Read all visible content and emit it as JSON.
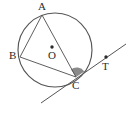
{
  "figure": {
    "kind": "circle-geometry-diagram",
    "background_color": "#ffffff",
    "stroke_color": "#555555",
    "label_color": "#2b2b2b",
    "shade_color": "#8a8a8a",
    "width": 133,
    "height": 115
  },
  "circle": {
    "name": "circle-O",
    "center": {
      "x": 55,
      "y": 50
    },
    "radius": 37,
    "center_marker": {
      "x": 52,
      "y": 47,
      "radius": 1.6
    }
  },
  "points": [
    {
      "id": "A",
      "label": "A",
      "x": 42,
      "y": 15,
      "label_x": 38,
      "label_y": 1,
      "on_circle": true
    },
    {
      "id": "B",
      "label": "B",
      "x": 20,
      "y": 57,
      "label_x": 9,
      "label_y": 50,
      "on_circle": true
    },
    {
      "id": "O",
      "label": "O",
      "x": 52,
      "y": 47,
      "label_x": 48,
      "label_y": 50,
      "on_circle": false
    },
    {
      "id": "C",
      "label": "C",
      "x": 76,
      "y": 77,
      "label_x": 72,
      "label_y": 80,
      "on_circle": true
    },
    {
      "id": "T",
      "label": "T",
      "x": 106,
      "y": 57,
      "label_x": 102,
      "label_y": 61,
      "on_circle": false
    }
  ],
  "chords": [
    {
      "name": "chord-AB",
      "from": "A",
      "to": "B",
      "x1": 42,
      "y1": 15,
      "x2": 20,
      "y2": 57
    },
    {
      "name": "chord-AC",
      "from": "A",
      "to": "C",
      "x1": 42,
      "y1": 15,
      "x2": 76,
      "y2": 77
    },
    {
      "name": "chord-BC",
      "from": "B",
      "to": "C",
      "x1": 20,
      "y1": 57,
      "x2": 76,
      "y2": 77
    }
  ],
  "tangent": {
    "name": "tangent-line-at-C",
    "x1": 41,
    "y1": 103,
    "x2": 126,
    "y2": 44,
    "touches_point": "C"
  },
  "angle_marker": {
    "name": "shaded-angle-ACT",
    "vertex": "C",
    "vertex_x": 76,
    "vertex_y": 77,
    "radius": 9,
    "path": "M 76 77 L 70.9 69.6 A 9 9 0 0 1 84.3 71.5 Z",
    "fill": "#8a8a8a"
  },
  "point_dots": [
    {
      "name": "dot-center-O",
      "x": 52,
      "y": 47,
      "r": 1.7
    },
    {
      "name": "dot-point-T",
      "x": 106,
      "y": 57,
      "r": 1.7
    }
  ]
}
